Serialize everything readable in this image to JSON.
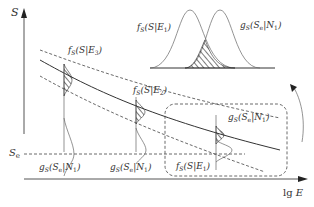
{
  "diagram": {
    "axes": {
      "y_label": "S",
      "x_label_prefix": "lg ",
      "x_label_var": "E",
      "threshold_label_main": "S",
      "threshold_label_sub": "e"
    },
    "curve_labels": {
      "fs_e3": {
        "f": "f",
        "sub": "S",
        "body": "(S|E",
        "idx": "3",
        "close": ")"
      },
      "fs_e2": {
        "f": "f",
        "sub": "S",
        "body": "(S|E",
        "idx": "2",
        "close": ")"
      },
      "fs_e1_box": {
        "f": "f",
        "sub": "S",
        "body": "(S|E",
        "idx": "1",
        "close": ")"
      },
      "fs_e1_inset": {
        "f": "f",
        "sub": "S",
        "body": "(S|E",
        "idx": "1",
        "close": ")"
      }
    },
    "noise_labels": {
      "gs_n1_left": {
        "g": "g",
        "sub": "S",
        "body": "(S",
        "sube": "e",
        "mid": "|N",
        "idx": "1",
        "close": ")"
      },
      "gs_n1_mid": {
        "g": "g",
        "sub": "S",
        "body": "(S",
        "sube": "e",
        "mid": "|N",
        "idx": "1",
        "close": ")"
      },
      "gs_n1_box": {
        "g": "g",
        "sub": "S",
        "body": "(S",
        "sube": "e",
        "mid": "|N",
        "idx": "1",
        "close": ")"
      },
      "gs_n1_inset": {
        "g": "g",
        "sub": "S",
        "body": "(S",
        "sube": "e",
        "mid": "|N",
        "idx": "1",
        "close": ")"
      }
    },
    "colors": {
      "line": "#333333",
      "background": "#ffffff"
    }
  }
}
